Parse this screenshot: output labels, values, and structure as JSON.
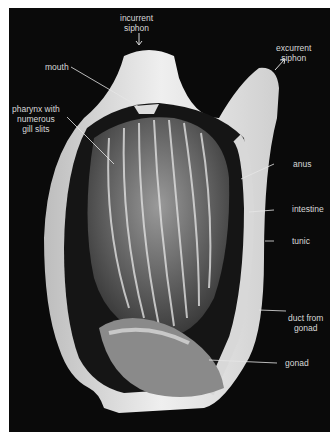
{
  "figure": {
    "background_color": "#0a0a0a",
    "label_color": "#d8d8d8",
    "labels": [
      {
        "id": "incurrent-siphon",
        "line1": "incurrent",
        "line2": "siphon"
      },
      {
        "id": "excurrent-siphon",
        "line1": "excurrent",
        "line2": "siphon"
      },
      {
        "id": "mouth",
        "line1": "mouth"
      },
      {
        "id": "pharynx",
        "line1": "pharynx with",
        "line2": "numerous",
        "line3": "gill slits"
      },
      {
        "id": "anus",
        "line1": "anus"
      },
      {
        "id": "intestine",
        "line1": "intestine"
      },
      {
        "id": "tunic",
        "line1": "tunic"
      },
      {
        "id": "duct-from-gonad",
        "line1": "duct from",
        "line2": "gonad"
      },
      {
        "id": "gonad",
        "line1": "gonad"
      }
    ]
  }
}
